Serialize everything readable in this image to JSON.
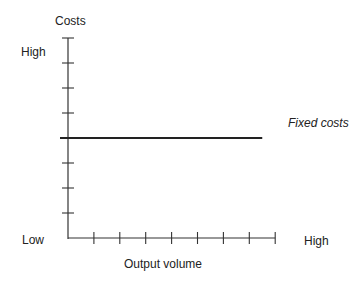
{
  "chart_data": {
    "type": "line",
    "title": "",
    "xlabel": "Output volume",
    "ylabel": "Costs",
    "x_tick_labels": {
      "low": "Low",
      "high": "High"
    },
    "y_tick_labels": {
      "low": "Low",
      "high": "High"
    },
    "x_tick_count": 8,
    "y_tick_count": 8,
    "xlim": [
      0,
      8
    ],
    "ylim": [
      0,
      8
    ],
    "grid": false,
    "series": [
      {
        "name": "Fixed costs",
        "style": "solid",
        "x": [
          0,
          7.5
        ],
        "y": [
          4,
          4
        ]
      }
    ],
    "annotations": [
      {
        "text": "Fixed costs",
        "style": "italic",
        "position": "right of line end"
      }
    ]
  },
  "labels": {
    "y_axis_title": "Costs",
    "y_high": "High",
    "origin_low": "Low",
    "x_high": "High",
    "x_axis_title": "Output volume",
    "series_label": "Fixed costs"
  },
  "colors": {
    "axis": "#333333",
    "line": "#222222",
    "text": "#222222"
  }
}
